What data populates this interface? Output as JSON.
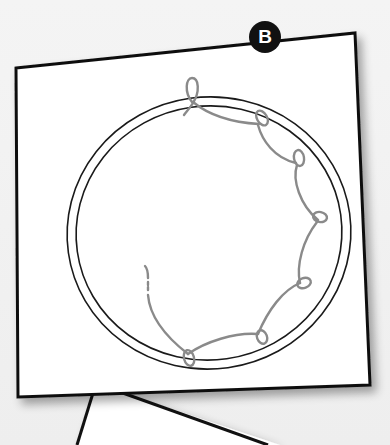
{
  "figure": {
    "step_badge": {
      "label": "B",
      "background_color": "#111111",
      "text_color": "#ffffff"
    },
    "card": {
      "background_color": "#ffffff",
      "border_color": "#111111"
    },
    "illustration": {
      "subject": "embroidery hoop with looped thread stitches around the rim",
      "hoop_color": "#1a1a1a",
      "thread_color": "#8a8a8a",
      "loop_count": 6
    },
    "callout_pointer": {
      "color": "#111111"
    }
  }
}
